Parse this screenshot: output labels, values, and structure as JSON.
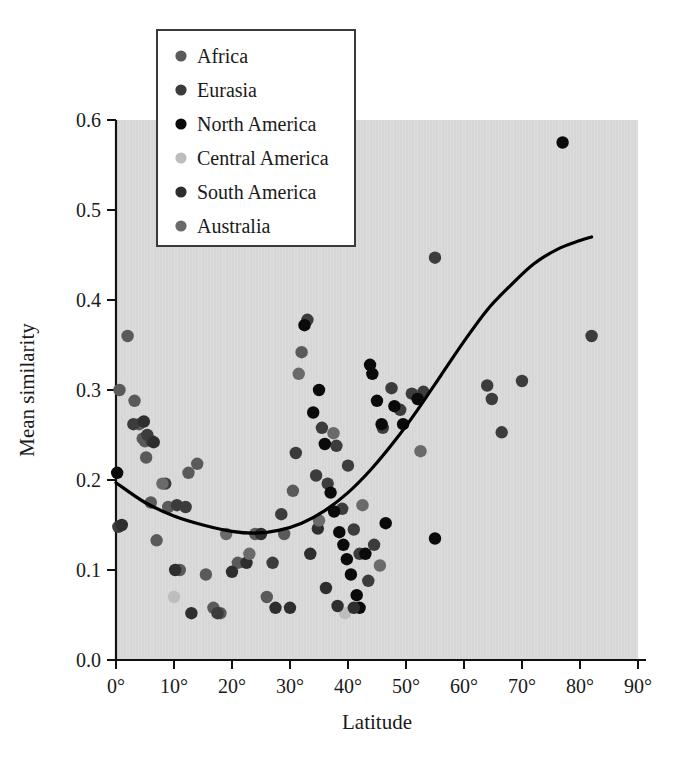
{
  "chart_data": {
    "type": "scatter",
    "title": "",
    "xlabel": "Latitude",
    "ylabel": "Mean similarity",
    "xlim": [
      0,
      90
    ],
    "ylim": [
      0.0,
      0.6
    ],
    "grid": false,
    "plot_background": "#dcdcdc",
    "xticks": [
      "0°",
      "10°",
      "20°",
      "30°",
      "40°",
      "50°",
      "60°",
      "70°",
      "80°",
      "90°"
    ],
    "xtick_values": [
      0,
      10,
      20,
      30,
      40,
      50,
      60,
      70,
      80,
      90
    ],
    "yticks": [
      "0.0",
      "0.1",
      "0.2",
      "0.3",
      "0.4",
      "0.5",
      "0.6"
    ],
    "ytick_values": [
      0.0,
      0.1,
      0.2,
      0.3,
      0.4,
      0.5,
      0.6
    ],
    "legend_position": "top-left",
    "legend": [
      {
        "name": "Africa",
        "color": "#5a5a5a"
      },
      {
        "name": "Eurasia",
        "color": "#3c3c3c"
      },
      {
        "name": "North America",
        "color": "#0a0a0a"
      },
      {
        "name": "Central America",
        "color": "#bdbdbd"
      },
      {
        "name": "South America",
        "color": "#2e2e2e"
      },
      {
        "name": "Australia",
        "color": "#6a6a6a"
      }
    ],
    "series": [
      {
        "name": "Africa",
        "color": "#5a5a5a",
        "points": [
          [
            0.6,
            0.3
          ],
          [
            2.0,
            0.36
          ],
          [
            3.2,
            0.288
          ],
          [
            4.0,
            0.262
          ],
          [
            4.6,
            0.246
          ],
          [
            5.0,
            0.243
          ],
          [
            5.2,
            0.225
          ],
          [
            6.0,
            0.175
          ],
          [
            7.0,
            0.133
          ],
          [
            9.0,
            0.17
          ],
          [
            11.0,
            0.1
          ],
          [
            12.5,
            0.208
          ],
          [
            14.0,
            0.218
          ],
          [
            15.5,
            0.095
          ],
          [
            16.8,
            0.058
          ],
          [
            18.0,
            0.052
          ],
          [
            21.0,
            0.108
          ],
          [
            24.0,
            0.14
          ],
          [
            26.0,
            0.07
          ],
          [
            29.0,
            0.14
          ],
          [
            30.5,
            0.188
          ],
          [
            32.0,
            0.342
          ]
        ]
      },
      {
        "name": "Eurasia",
        "color": "#3c3c3c",
        "points": [
          [
            0.4,
            0.148
          ],
          [
            3.0,
            0.262
          ],
          [
            5.4,
            0.25
          ],
          [
            6.2,
            0.243
          ],
          [
            8.5,
            0.196
          ],
          [
            10.5,
            0.172
          ],
          [
            12.0,
            0.17
          ],
          [
            17.5,
            0.052
          ],
          [
            27.0,
            0.108
          ],
          [
            28.5,
            0.162
          ],
          [
            31.0,
            0.23
          ],
          [
            33.0,
            0.378
          ],
          [
            34.5,
            0.205
          ],
          [
            35.5,
            0.258
          ],
          [
            36.5,
            0.196
          ],
          [
            38.0,
            0.238
          ],
          [
            39.0,
            0.168
          ],
          [
            40.0,
            0.216
          ],
          [
            41.0,
            0.145
          ],
          [
            42.0,
            0.118
          ],
          [
            43.5,
            0.088
          ],
          [
            44.5,
            0.128
          ],
          [
            46.0,
            0.258
          ],
          [
            47.5,
            0.302
          ],
          [
            49.0,
            0.278
          ],
          [
            51.0,
            0.296
          ],
          [
            53.0,
            0.298
          ],
          [
            55.0,
            0.447
          ],
          [
            64.0,
            0.305
          ],
          [
            64.8,
            0.29
          ],
          [
            66.5,
            0.253
          ],
          [
            70.0,
            0.31
          ],
          [
            82.0,
            0.36
          ]
        ]
      },
      {
        "name": "North America",
        "color": "#0a0a0a",
        "points": [
          [
            0.2,
            0.208
          ],
          [
            32.5,
            0.372
          ],
          [
            34.0,
            0.275
          ],
          [
            35.0,
            0.3
          ],
          [
            36.0,
            0.24
          ],
          [
            37.0,
            0.186
          ],
          [
            37.6,
            0.165
          ],
          [
            38.5,
            0.142
          ],
          [
            39.2,
            0.128
          ],
          [
            39.8,
            0.112
          ],
          [
            40.5,
            0.095
          ],
          [
            41.5,
            0.072
          ],
          [
            42.0,
            0.058
          ],
          [
            43.0,
            0.118
          ],
          [
            43.8,
            0.328
          ],
          [
            44.2,
            0.318
          ],
          [
            45.0,
            0.288
          ],
          [
            45.8,
            0.262
          ],
          [
            46.5,
            0.152
          ],
          [
            48.0,
            0.282
          ],
          [
            49.5,
            0.262
          ],
          [
            52.0,
            0.29
          ],
          [
            55.0,
            0.135
          ],
          [
            77.0,
            0.575
          ]
        ]
      },
      {
        "name": "Central America",
        "color": "#bdbdbd",
        "points": [
          [
            10.0,
            0.07
          ],
          [
            39.5,
            0.052
          ]
        ]
      },
      {
        "name": "South America",
        "color": "#2e2e2e",
        "points": [
          [
            1.0,
            0.15
          ],
          [
            4.8,
            0.265
          ],
          [
            6.5,
            0.242
          ],
          [
            10.2,
            0.1
          ],
          [
            13.0,
            0.052
          ],
          [
            20.0,
            0.098
          ],
          [
            22.5,
            0.108
          ],
          [
            25.0,
            0.14
          ],
          [
            27.5,
            0.058
          ],
          [
            30.0,
            0.058
          ],
          [
            33.5,
            0.118
          ],
          [
            34.8,
            0.146
          ],
          [
            36.2,
            0.08
          ],
          [
            38.2,
            0.06
          ],
          [
            41.0,
            0.058
          ]
        ]
      },
      {
        "name": "Australia",
        "color": "#6a6a6a",
        "points": [
          [
            8.0,
            0.196
          ],
          [
            19.0,
            0.14
          ],
          [
            23.0,
            0.118
          ],
          [
            31.5,
            0.318
          ],
          [
            35.0,
            0.155
          ],
          [
            37.5,
            0.252
          ],
          [
            42.5,
            0.172
          ],
          [
            45.5,
            0.105
          ],
          [
            52.5,
            0.232
          ]
        ]
      }
    ],
    "fit_curve": {
      "description": "quadratic trend line",
      "color": "#000000",
      "points": [
        [
          0,
          0.197
        ],
        [
          5,
          0.175
        ],
        [
          10,
          0.16
        ],
        [
          15,
          0.15
        ],
        [
          20,
          0.143
        ],
        [
          24,
          0.141
        ],
        [
          28,
          0.144
        ],
        [
          32,
          0.152
        ],
        [
          36,
          0.166
        ],
        [
          40,
          0.186
        ],
        [
          44,
          0.212
        ],
        [
          48,
          0.243
        ],
        [
          52,
          0.278
        ],
        [
          56,
          0.316
        ],
        [
          60,
          0.354
        ],
        [
          64,
          0.389
        ],
        [
          68,
          0.416
        ],
        [
          72,
          0.44
        ],
        [
          76,
          0.456
        ],
        [
          80,
          0.466
        ],
        [
          82,
          0.47
        ]
      ]
    }
  }
}
